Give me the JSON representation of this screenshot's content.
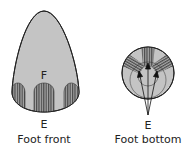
{
  "figures": [
    {
      "id": "foot-front",
      "caption": "Foot front",
      "labels": [
        {
          "text": "F",
          "x": 44,
          "y": 70
        },
        {
          "text": "E",
          "x": 44,
          "y": 119
        }
      ]
    },
    {
      "id": "foot-bottom",
      "caption": "Foot bottom",
      "labels": [
        {
          "text": "E",
          "x": 148,
          "y": 120
        }
      ]
    }
  ],
  "colors": {
    "fill": "#c4c4c4",
    "stripe_dark": "#555555",
    "stripe_light": "#9a9a9a",
    "outline": "#222222"
  }
}
